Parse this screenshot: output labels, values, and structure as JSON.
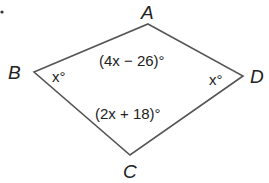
{
  "diagram": {
    "type": "quadrilateral (kite)",
    "vertices": {
      "A": {
        "label": "A",
        "x": 148,
        "y": 24
      },
      "B": {
        "label": "B",
        "x": 34,
        "y": 72
      },
      "C": {
        "label": "C",
        "x": 130,
        "y": 155
      },
      "D": {
        "label": "D",
        "x": 243,
        "y": 76
      }
    },
    "angles": {
      "A": "(4x − 26)°",
      "B": "x°",
      "C": "(2x + 18)°",
      "D": "x°"
    },
    "line_color": "#555555",
    "text_color": "#222222"
  }
}
